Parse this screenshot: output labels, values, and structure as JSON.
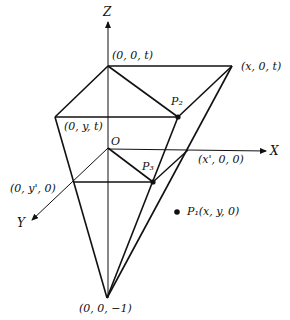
{
  "diagram": {
    "type": "3d-perspective-projection",
    "axes": {
      "z": "Z",
      "x": "X",
      "y": "Y"
    },
    "labels": {
      "top_origin": "(0, 0, t)",
      "top_x": "(x, 0, t)",
      "top_y": "(0, y, t)",
      "origin": "O",
      "x_prime": "(x', 0, 0)",
      "y_prime": "(0, y', 0)",
      "apex": "(0, 0, −1)",
      "p1": "P₁(x, y, 0)",
      "p2": "P₂",
      "p3": "P₃"
    },
    "points": {
      "zt": [
        108,
        66
      ],
      "xt": [
        232,
        66
      ],
      "yt": [
        55,
        117
      ],
      "p2": [
        178,
        117
      ],
      "o": [
        108,
        148
      ],
      "xp": [
        188,
        150
      ],
      "yp": [
        73,
        182
      ],
      "p3": [
        153,
        182
      ],
      "apex": [
        107,
        298
      ],
      "p1": [
        177,
        212
      ]
    },
    "colors": {
      "line": "#111111",
      "background": "#ffffff"
    }
  }
}
